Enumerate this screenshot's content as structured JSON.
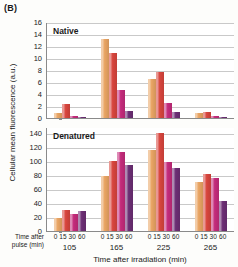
{
  "figure": {
    "panel_letter": "(B)",
    "ylabel": "Cellular mean fluorescence (a.u.)",
    "xlabel": "Time after irradiation (min)",
    "pulse_caption_line1": "Time after",
    "pulse_caption_line2": "pulse (min)"
  },
  "series_colors": {
    "t0": "#E9A463",
    "t15": "#D8453D",
    "t30": "#C42B7B",
    "t60": "#6C2E74"
  },
  "panels": [
    {
      "key": "native",
      "title": "Native",
      "yticks": [
        0,
        2,
        4,
        6,
        8,
        10,
        12,
        14,
        16
      ],
      "ymax": 16
    },
    {
      "key": "denatured",
      "title": "Denatured",
      "yticks": [
        0,
        20,
        40,
        60,
        80,
        100,
        120,
        140
      ],
      "ymax": 148
    }
  ],
  "chart_data": {
    "type": "bar",
    "xlabel": "Time after irradiation (min)",
    "ylabel": "Cellular mean fluorescence (a.u.)",
    "grid": true,
    "legend": "none",
    "subplot_labels": [
      "Native",
      "Denatured"
    ],
    "categories": [
      "105",
      "165",
      "225",
      "265"
    ],
    "subcategory_label": "Time after pulse (min)",
    "subcategories": [
      "0",
      "15",
      "30",
      "60"
    ],
    "panels": [
      {
        "name": "Native",
        "ylim": [
          0,
          16
        ],
        "yticks": [
          0,
          2,
          4,
          6,
          8,
          10,
          12,
          14,
          16
        ],
        "series": [
          {
            "name": "0",
            "color": "#E9A463",
            "values": [
              0.9,
              13.1,
              6.5,
              0.8
            ]
          },
          {
            "name": "15",
            "color": "#D8453D",
            "values": [
              2.3,
              10.8,
              7.6,
              1.0
            ]
          },
          {
            "name": "30",
            "color": "#C42B7B",
            "values": [
              0.3,
              4.6,
              2.5,
              0.4
            ]
          },
          {
            "name": "60",
            "color": "#6C2E74",
            "values": [
              0.15,
              1.2,
              1.0,
              0.2
            ]
          }
        ]
      },
      {
        "name": "Denatured",
        "ylim": [
          0,
          148
        ],
        "yticks": [
          0,
          20,
          40,
          60,
          80,
          100,
          120,
          140
        ],
        "series": [
          {
            "name": "0",
            "color": "#E9A463",
            "values": [
              19,
              78,
              116,
              70
            ]
          },
          {
            "name": "15",
            "color": "#D8453D",
            "values": [
              30,
              99,
              140,
              81
            ]
          },
          {
            "name": "30",
            "color": "#C42B7B",
            "values": [
              24,
              112,
              98,
              75
            ]
          },
          {
            "name": "60",
            "color": "#6C2E74",
            "values": [
              29,
              94,
              90,
              43
            ]
          }
        ]
      }
    ]
  }
}
